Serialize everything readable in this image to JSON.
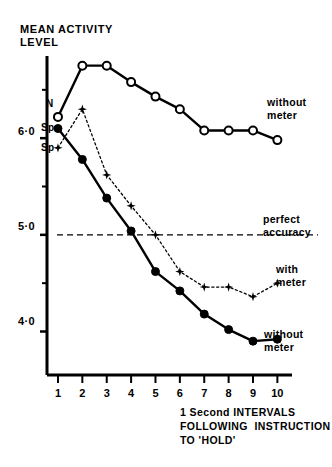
{
  "title": {
    "line1": "MEAN ACTIVITY",
    "line2": "LEVEL"
  },
  "axes": {
    "y_ticks_major": [
      "6·0",
      "5·0",
      "4·0"
    ],
    "y_tick_values": [
      6.0,
      5.0,
      4.0
    ],
    "y_minor_values": [
      6.5,
      5.5,
      4.5
    ],
    "x_ticks": [
      "1",
      "2",
      "3",
      "4",
      "5",
      "6",
      "7",
      "8",
      "9",
      "10"
    ],
    "x_caption_line1": "1 Second INTERVALS",
    "x_caption_line2": "FOLLOWING  INSTRUCTION",
    "x_caption_line3": "TO 'HOLD'"
  },
  "point_labels": {
    "n": "N",
    "sp_upper": "Sp",
    "sp_lower": "Sp"
  },
  "annotations": {
    "without_meter_top": "without\nmeter",
    "perfect_accuracy": "perfect\naccuracy",
    "with_meter": "with\nmeter",
    "without_meter_bottom": "without\nmeter"
  },
  "colors": {
    "ink": "#000000",
    "paper": "#ffffff"
  },
  "chart_data": {
    "type": "line",
    "title": "MEAN ACTIVITY LEVEL",
    "xlabel": "1 Second INTERVALS FOLLOWING INSTRUCTION TO 'HOLD'",
    "ylabel": "MEAN ACTIVITY LEVEL",
    "x": [
      1,
      2,
      3,
      4,
      5,
      6,
      7,
      8,
      9,
      10
    ],
    "xlim": [
      0.55,
      10.6
    ],
    "ylim": [
      3.55,
      6.85
    ],
    "grid": false,
    "legend": "inline-annotations",
    "series": [
      {
        "name": "without meter (N)",
        "marker": "open-circle",
        "linestyle": "solid",
        "start_label": "N",
        "end_label": "without meter",
        "values": [
          6.22,
          6.75,
          6.75,
          6.58,
          6.43,
          6.3,
          6.08,
          6.08,
          6.08,
          5.98
        ]
      },
      {
        "name": "without meter (Sp)",
        "marker": "filled-circle",
        "linestyle": "solid",
        "start_label": "Sp",
        "end_label": "without meter",
        "values": [
          6.1,
          5.78,
          5.38,
          5.04,
          4.62,
          4.42,
          4.18,
          4.02,
          3.9,
          3.92
        ]
      },
      {
        "name": "with meter (Sp)",
        "marker": "star",
        "linestyle": "dotted",
        "start_label": "Sp",
        "end_label": "with meter",
        "values": [
          5.9,
          6.3,
          5.62,
          5.3,
          5.0,
          4.62,
          4.46,
          4.46,
          4.36,
          4.5
        ]
      }
    ],
    "reference_lines": [
      {
        "name": "perfect accuracy",
        "orientation": "horizontal",
        "value": 5.0,
        "linestyle": "dashed",
        "label": "perfect accuracy"
      }
    ]
  }
}
